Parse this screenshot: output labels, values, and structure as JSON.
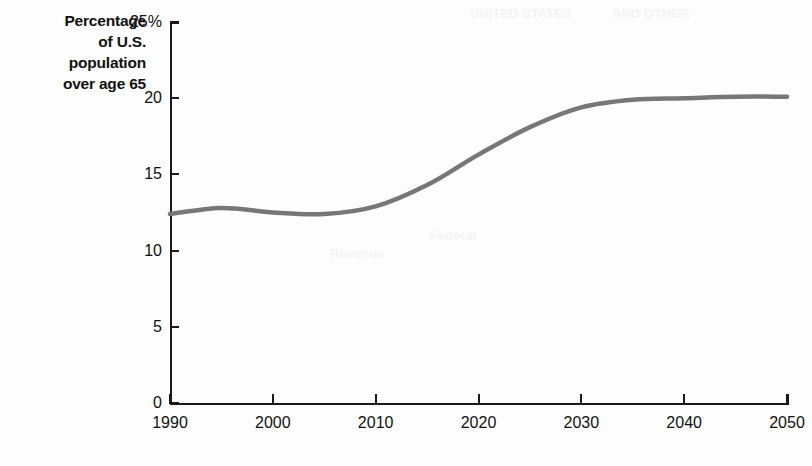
{
  "figure": {
    "axis_title_lines": [
      "Percentage",
      "of U.S.",
      "population",
      "over age 65"
    ],
    "line_color": "#777777",
    "axis_color": "#1a1a1a",
    "background": "#fdfdfd"
  },
  "chart_data": {
    "type": "line",
    "title": "",
    "subtitle": "",
    "xlabel": "",
    "ylabel": "Percentage of U.S. population over age 65",
    "xlim": [
      1990,
      2050
    ],
    "ylim": [
      0,
      25
    ],
    "grid": false,
    "legend": null,
    "y_tick_labels": [
      "0",
      "5",
      "10",
      "15",
      "20",
      "25%"
    ],
    "y_ticks": [
      0,
      5,
      10,
      15,
      20,
      25
    ],
    "x_tick_labels": [
      "1990",
      "2000",
      "2010",
      "2020",
      "2030",
      "2040",
      "2050"
    ],
    "x_ticks": [
      1990,
      2000,
      2010,
      2020,
      2030,
      2040,
      2050
    ],
    "series": [
      {
        "name": "Percentage of U.S. population over age 65",
        "x": [
          1990,
          1995,
          2000,
          2005,
          2010,
          2015,
          2020,
          2025,
          2030,
          2035,
          2040,
          2045,
          2050
        ],
        "values": [
          12.4,
          12.8,
          12.5,
          12.4,
          12.9,
          14.3,
          16.3,
          18.1,
          19.4,
          19.9,
          20.0,
          20.1,
          20.1
        ]
      }
    ]
  },
  "ghost_text": [
    {
      "text": "UNITED STATES",
      "x": 470,
      "y": 6
    },
    {
      "text": "AND OTHER",
      "x": 612,
      "y": 6
    },
    {
      "text": "Federal",
      "x": 430,
      "y": 228
    },
    {
      "text": "Revenue",
      "x": 330,
      "y": 246
    }
  ]
}
